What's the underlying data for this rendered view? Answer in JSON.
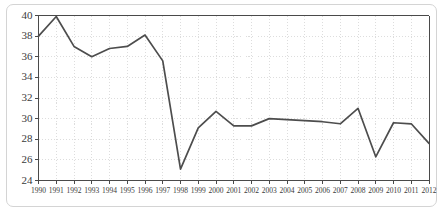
{
  "chart_data": {
    "type": "line",
    "title": "",
    "subtitle": "",
    "xlabel": "",
    "ylabel": "",
    "categories": [
      "1990",
      "1991",
      "1992",
      "1993",
      "1994",
      "1995",
      "1996",
      "1997",
      "1998",
      "1999",
      "2000",
      "2001",
      "2002",
      "2003",
      "2004",
      "2005",
      "2006",
      "2007",
      "2008",
      "2009",
      "2010",
      "2011",
      "2012"
    ],
    "values": [
      38.0,
      39.9,
      37.0,
      36.0,
      36.8,
      37.0,
      38.1,
      35.6,
      25.1,
      29.1,
      30.7,
      29.3,
      29.3,
      30.0,
      29.9,
      29.8,
      29.7,
      29.5,
      31.0,
      26.3,
      29.6,
      29.5,
      27.6
    ],
    "series": [
      {
        "name": "series-1",
        "values": [
          38.0,
          39.9,
          37.0,
          36.0,
          36.8,
          37.0,
          38.1,
          35.6,
          25.1,
          29.1,
          30.7,
          29.3,
          29.3,
          30.0,
          29.9,
          29.8,
          29.7,
          29.5,
          31.0,
          26.3,
          29.6,
          29.5,
          27.6
        ]
      }
    ],
    "x": [
      1990,
      1991,
      1992,
      1993,
      1994,
      1995,
      1996,
      1997,
      1998,
      1999,
      2000,
      2001,
      2002,
      2003,
      2004,
      2005,
      2006,
      2007,
      2008,
      2009,
      2010,
      2011,
      2012
    ],
    "ylim": [
      24,
      40
    ],
    "xlim": [
      1990,
      2012
    ],
    "y_ticks": [
      24,
      26,
      28,
      30,
      32,
      34,
      36,
      38,
      40
    ],
    "y_tick_labels": [
      "24",
      "26",
      "28",
      "30",
      "32",
      "34",
      "36",
      "38",
      "40"
    ],
    "x_ticks": [
      1990,
      1991,
      1992,
      1993,
      1994,
      1995,
      1996,
      1997,
      1998,
      1999,
      2000,
      2001,
      2002,
      2003,
      2004,
      2005,
      2006,
      2007,
      2008,
      2009,
      2010,
      2011,
      2012
    ],
    "x_tick_labels": [
      "1990",
      "1991",
      "1992",
      "1993",
      "1994",
      "1995",
      "1996",
      "1997",
      "1998",
      "1999",
      "2000",
      "2001",
      "2002",
      "2003",
      "2004",
      "2005",
      "2006",
      "2007",
      "2008",
      "2009",
      "2010",
      "2011",
      "2012"
    ],
    "grid": true,
    "grid_style": "dotted",
    "legend": null,
    "legend_position": "none",
    "annotations": [],
    "colors": {
      "line": "#4d4d4d",
      "grid": "#cfcfcf",
      "axis": "#4a4a4a",
      "frame": "#d4d4d4",
      "background": "#ffffff",
      "text": "#3a3a3a"
    }
  }
}
